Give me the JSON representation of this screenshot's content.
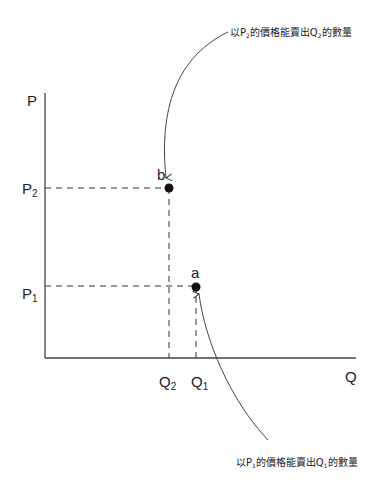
{
  "diagram": {
    "type": "price-quantity-diagram",
    "axes": {
      "y_label": "P",
      "x_label": "Q"
    },
    "price_levels": [
      {
        "label": "P",
        "sub": "2"
      },
      {
        "label": "P",
        "sub": "1"
      }
    ],
    "quantity_levels": [
      {
        "label": "Q",
        "sub": "2"
      },
      {
        "label": "Q",
        "sub": "1"
      }
    ],
    "points": [
      {
        "label": "b",
        "price": "P2",
        "quantity": "Q2"
      },
      {
        "label": "a",
        "price": "P1",
        "quantity": "Q1"
      }
    ],
    "annotations": {
      "top": {
        "pre": "以P",
        "sub1": "2",
        "mid": "的價格能賣出Q",
        "sub2": "2",
        "post": "的數量"
      },
      "bottom": {
        "pre": "以P",
        "sub1": "1",
        "mid": "的價格能賣出Q",
        "sub2": "1",
        "post": "的數量"
      }
    },
    "colors": {
      "line": "#333333",
      "point": "#111111",
      "text": "#222222"
    }
  }
}
